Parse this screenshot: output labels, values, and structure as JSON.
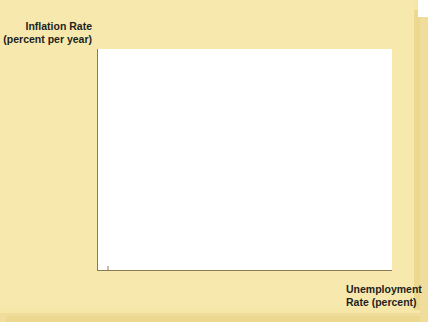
{
  "chart_data": {
    "type": "scatter",
    "title": "",
    "xlabel": "Unemployment Rate (percent)",
    "ylabel": "Inflation Rate (percent per year)",
    "xlim": [
      0,
      11
    ],
    "ylim": [
      0,
      11
    ],
    "grid": false,
    "legend": "none",
    "connected": true,
    "line_color": "#b5472a",
    "point_color": "#1a1a1a",
    "xticks": [
      "1%",
      "2",
      "3",
      "4",
      "5",
      "6",
      "7",
      "8",
      "9",
      "10"
    ],
    "xtick_values": [
      1,
      2,
      3,
      4,
      5,
      6,
      7,
      8,
      9,
      10
    ],
    "yticks": [
      "2",
      "4",
      "6",
      "8",
      "10%"
    ],
    "ytick_values": [
      2,
      4,
      6,
      8,
      10
    ],
    "origin_label": "0",
    "point_labels": [
      "1972",
      "1973",
      "1974",
      "1975",
      "1976",
      "1977",
      "1978",
      "1979",
      "1980",
      "1981"
    ],
    "x": [
      5.1,
      4.3,
      5.1,
      7.5,
      6.8,
      6.2,
      5.4,
      5.2,
      6.3,
      6.7
    ],
    "y": [
      3.9,
      5.8,
      8.7,
      9.5,
      6.0,
      6.4,
      7.8,
      8.6,
      9.2,
      9.3
    ],
    "points": [
      {
        "label": "1972",
        "x": 5.1,
        "y": 3.9,
        "label_pos": "below-right"
      },
      {
        "label": "1973",
        "x": 4.3,
        "y": 5.8,
        "label_pos": "left"
      },
      {
        "label": "1974",
        "x": 5.1,
        "y": 8.7,
        "label_pos": "left"
      },
      {
        "label": "1975",
        "x": 7.5,
        "y": 9.5,
        "label_pos": "right"
      },
      {
        "label": "1976",
        "x": 6.8,
        "y": 6.0,
        "label_pos": "right"
      },
      {
        "label": "1977",
        "x": 6.2,
        "y": 6.4,
        "label_pos": "left"
      },
      {
        "label": "1978",
        "x": 5.4,
        "y": 7.8,
        "label_pos": "right"
      },
      {
        "label": "1979",
        "x": 5.2,
        "y": 8.6,
        "label_pos": "right"
      },
      {
        "label": "1980",
        "x": 6.3,
        "y": 9.2,
        "label_pos": "above-left"
      },
      {
        "label": "1981",
        "x": 6.7,
        "y": 9.3,
        "label_pos": "above"
      }
    ]
  },
  "colors": {
    "panel_background": "#ffffff",
    "figure_background": "#f7e8ae",
    "axis": "#8a7a52",
    "line": "#b5472a",
    "marker": "#1a1a1a",
    "text": "#231f20"
  },
  "axis_titles": {
    "y_line1": "Inflation Rate",
    "y_line2": "(percent per year)",
    "x_line1": "Unemployment",
    "x_line2": "Rate (percent)"
  }
}
